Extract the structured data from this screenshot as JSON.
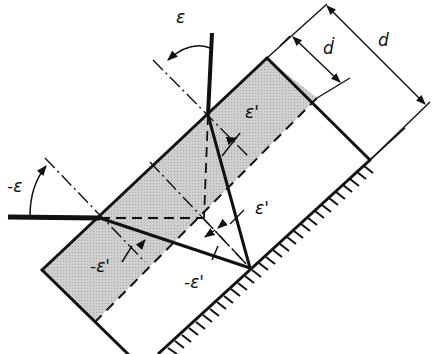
{
  "diagram": {
    "type": "optical-ray-diagram",
    "colors": {
      "plate_fill": "#c8c8c8",
      "line": "#111111",
      "background": "#ffffff"
    },
    "labels": {
      "eps_top": "ε",
      "eps_left": "-ε",
      "eps_prime_upper": "ε'",
      "eps_prime_mid": "ε'",
      "neg_eps_prime_left": "-ε'",
      "neg_eps_prime_bottom": "-ε'",
      "d_dot": "ḋ",
      "d": "d"
    },
    "dimensions": [
      {
        "name": "d-dot",
        "label": "ḋ",
        "meaning": "thickness of shaded layer"
      },
      {
        "name": "d",
        "label": "d",
        "meaning": "total thickness to mirror"
      }
    ]
  }
}
